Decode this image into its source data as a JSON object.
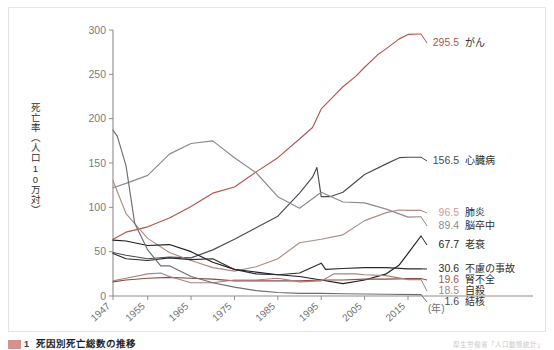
{
  "figure": {
    "caption_tag": "図",
    "caption_number": "1",
    "caption_title": "死因別死亡総数の推移",
    "caption_source": "厚生労働省「人口動態統計」"
  },
  "chart_data": {
    "type": "line",
    "title": "死因別死亡総数の推移",
    "xlabel": "(年)",
    "ylabel": "死亡率（人口10万対）",
    "xlim": [
      1947,
      2018
    ],
    "ylim": [
      0,
      300
    ],
    "ytick_step": 50,
    "grid": false,
    "legend_position": "right-inline-labels",
    "yticks": [
      "0",
      "50",
      "100",
      "150",
      "200",
      "250",
      "300"
    ],
    "xticks": [
      "1947",
      "1955",
      "1965",
      "1975",
      "1985",
      "1995",
      "2005",
      "2015"
    ],
    "xtick_values": [
      1947,
      1955,
      1965,
      1975,
      1985,
      1995,
      2005,
      2015
    ],
    "x_axis_unit": "(年)",
    "series": [
      {
        "name": "がん",
        "end_value": "295.5",
        "color": "#b4554d",
        "label_color": "#b4554d",
        "x": [
          1947,
          1950,
          1955,
          1960,
          1965,
          1970,
          1975,
          1980,
          1985,
          1990,
          1993,
          1995,
          1998,
          2000,
          2003,
          2005,
          2008,
          2010,
          2013,
          2015,
          2018
        ],
        "values": [
          64,
          72,
          78,
          88,
          101,
          116,
          123,
          140,
          156,
          177,
          190,
          211,
          226,
          236,
          248,
          258,
          272,
          279,
          290,
          295,
          295.5
        ]
      },
      {
        "name": "心臓病",
        "end_value": "156.5",
        "color": "#4a4a55",
        "label_color": "#4a4a55",
        "x": [
          1947,
          1950,
          1955,
          1960,
          1965,
          1970,
          1975,
          1980,
          1985,
          1990,
          1993,
          1994,
          1995,
          1997,
          2000,
          2005,
          2010,
          2013,
          2015,
          2018
        ],
        "values": [
          49,
          46,
          42,
          44,
          43,
          52,
          64,
          77,
          90,
          116,
          134,
          145,
          112,
          112,
          117,
          137,
          149,
          156,
          156.5,
          156.5
        ]
      },
      {
        "name": "肺炎",
        "end_value": "96.5",
        "color": "#b38985",
        "label_color": "#c89c97",
        "x": [
          1947,
          1950,
          1955,
          1960,
          1965,
          1970,
          1975,
          1980,
          1985,
          1990,
          1995,
          2000,
          2005,
          2010,
          2013,
          2015,
          2018
        ],
        "values": [
          130,
          93,
          65,
          49,
          40,
          32,
          28,
          33,
          42,
          60,
          64,
          69,
          85,
          94,
          97,
          96.5,
          96.5
        ]
      },
      {
        "name": "脳卒中",
        "end_value": "89.4",
        "color": "#8a8a92",
        "label_color": "#8a8a92",
        "x": [
          1947,
          1950,
          1955,
          1960,
          1965,
          1970,
          1975,
          1980,
          1985,
          1990,
          1995,
          2000,
          2005,
          2010,
          2015,
          2018
        ],
        "values": [
          122,
          127,
          136,
          160,
          172,
          175,
          156,
          139,
          112,
          99,
          117,
          106,
          105,
          98,
          89,
          89.4
        ]
      },
      {
        "name": "老衰",
        "end_value": "67.7",
        "color": "#1e1e22",
        "label_color": "#1e1e22",
        "x": [
          1947,
          1950,
          1955,
          1960,
          1965,
          1970,
          1975,
          1980,
          1985,
          1990,
          1995,
          2000,
          2005,
          2010,
          2013,
          2015,
          2018
        ],
        "values": [
          63,
          62,
          57,
          58,
          50,
          38,
          30,
          27,
          24,
          22,
          18,
          14,
          18,
          25,
          35,
          48,
          67.7
        ]
      },
      {
        "name": "不慮の事故",
        "end_value": "30.6",
        "color": "#2b2b30",
        "label_color": "#2b2b30",
        "x": [
          1947,
          1950,
          1955,
          1960,
          1965,
          1970,
          1975,
          1980,
          1985,
          1990,
          1995,
          1996,
          2000,
          2005,
          2010,
          2015,
          2018
        ],
        "values": [
          48,
          42,
          40,
          43,
          41,
          42,
          30,
          25,
          24,
          26,
          37,
          30,
          31,
          32,
          32,
          30.6,
          30.6
        ]
      },
      {
        "name": "腎不全",
        "end_value": "19.6",
        "color": "#8c4b43",
        "label_color": "#a2584f",
        "x": [
          1947,
          1950,
          1955,
          1960,
          1965,
          1970,
          1975,
          1980,
          1985,
          1990,
          1995,
          2000,
          2005,
          2010,
          2015,
          2018
        ],
        "values": [
          16,
          18,
          20,
          21,
          20,
          19,
          17,
          17,
          17,
          17,
          18,
          18,
          19,
          19,
          19.6,
          19.6
        ]
      },
      {
        "name": "自殺",
        "end_value": "18.5",
        "color": "#a8837c",
        "label_color": "#a8837c",
        "x": [
          1947,
          1950,
          1955,
          1958,
          1960,
          1965,
          1970,
          1975,
          1980,
          1985,
          1990,
          1995,
          1998,
          2003,
          2005,
          2010,
          2015,
          2018
        ],
        "values": [
          17,
          20,
          25,
          26,
          22,
          15,
          15,
          18,
          18,
          20,
          16,
          17,
          25,
          25,
          24,
          23,
          18.5,
          18.5
        ]
      },
      {
        "name": "結核",
        "end_value": "1.6",
        "color": "#6e6e72",
        "label_color": "#4a4a4a",
        "x": [
          1947,
          1948,
          1950,
          1952,
          1955,
          1958,
          1960,
          1965,
          1970,
          1975,
          1980,
          1985,
          1990,
          1995,
          2000,
          2010,
          2018
        ],
        "values": [
          187,
          180,
          147,
          82,
          52,
          34,
          34,
          22,
          15,
          10,
          6,
          4,
          3,
          3,
          2.5,
          2,
          1.6
        ]
      }
    ]
  }
}
